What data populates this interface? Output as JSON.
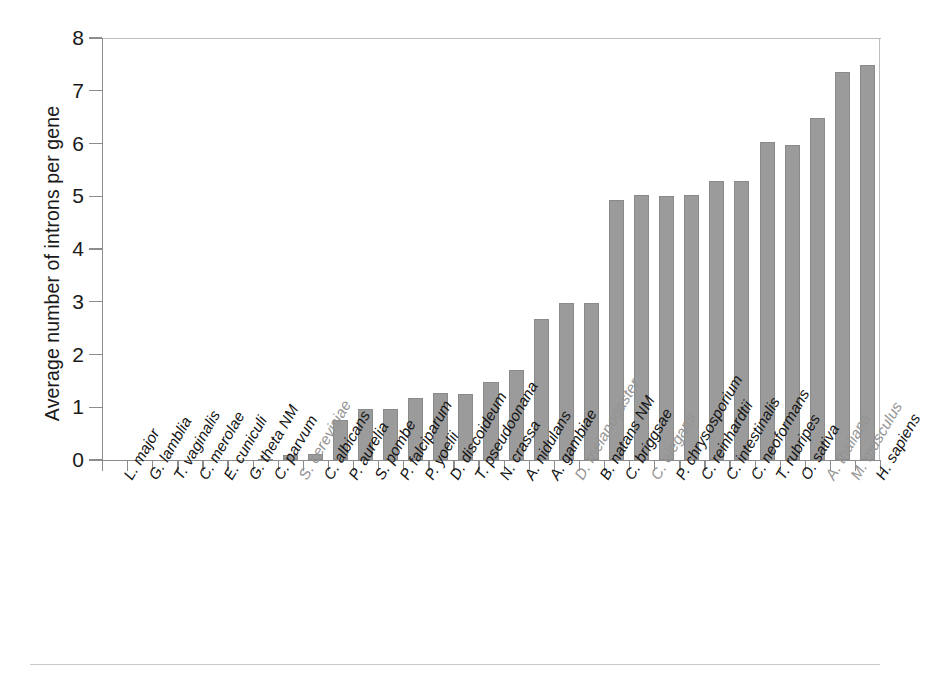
{
  "figure": {
    "background": "#ffffff",
    "bar_color": "#9b9b9b",
    "axis_color": "#8c8c8c",
    "label_color": "#141414",
    "highlight_label_color": "#949494"
  },
  "axis": {
    "y_title": "Average number of introns per gene",
    "y_ticks": [
      "0",
      "1",
      "2",
      "3",
      "4",
      "5",
      "6",
      "7",
      "8"
    ]
  },
  "chart_data": {
    "type": "bar",
    "title": "",
    "xlabel": "",
    "ylabel": "Average number of introns per gene",
    "ylim": [
      0,
      8
    ],
    "yticks": [
      0,
      1,
      2,
      3,
      4,
      5,
      6,
      7,
      8
    ],
    "grid": false,
    "legend": "none",
    "bar_color": "#9b9b9b",
    "categories": [
      "L. major",
      "G. lamblia",
      "T. vaginalis",
      "C. merolae",
      "E. cuniculi",
      "G. theta NM",
      "C. parvum",
      "S. cerevisiae",
      "C. albicans",
      "P. aurelia",
      "S. pombe",
      "P. falciparum",
      "P. yoelii",
      "D. discoideum",
      "T. pseudoonana",
      "N. crassa",
      "A. nidulans",
      "A. gambiae",
      "D. melanogaster",
      "B. natans NM",
      "C. briggsae",
      "C. elegans",
      "P. chrysosporium",
      "C. reinhardtii",
      "C. intestinalis",
      "C. neoformans",
      "T. rubripes",
      "O. sativa",
      "A. thaliana",
      "M. musculus",
      "H. sapiens"
    ],
    "values": [
      0.0,
      0.0,
      0.0,
      0.0,
      0.0,
      0.0,
      0.02,
      0.1,
      0.11,
      0.75,
      0.96,
      0.97,
      1.18,
      1.27,
      1.25,
      1.47,
      1.7,
      2.68,
      2.98,
      2.97,
      4.93,
      5.02,
      5.0,
      5.02,
      5.28,
      5.28,
      6.02,
      5.97,
      6.48,
      7.35,
      7.49
    ],
    "highlighted_categories": [
      "S. cerevisiae",
      "D. melanogaster",
      "C. elegans",
      "A. thaliana",
      "M. musculus"
    ]
  }
}
